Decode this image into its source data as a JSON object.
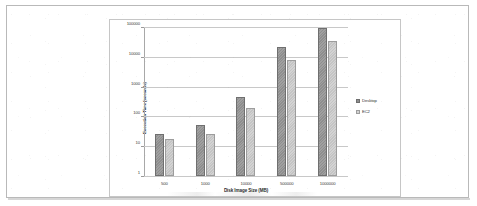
{
  "chart_data": {
    "type": "bar",
    "title": "",
    "subtitle": "",
    "xlabel": "Disk Image Size (MB)",
    "ylabel": "Execution Time (seconds)",
    "categories": [
      "500",
      "1000",
      "10000",
      "500000",
      "1000000"
    ],
    "series": [
      {
        "name": "Desktop",
        "color": "#8e8e8e",
        "values": [
          25,
          50,
          450,
          22000,
          90000
        ]
      },
      {
        "name": "EC2",
        "color": "#d3d3d3",
        "values": [
          17,
          25,
          190,
          8000,
          35000
        ]
      }
    ],
    "yscale": "log",
    "ylim": [
      1,
      100000
    ],
    "ytick_labels": [
      "1",
      "10",
      "100",
      "1000",
      "10000",
      "100000"
    ],
    "ytick_values": [
      1,
      10,
      100,
      1000,
      10000,
      100000
    ],
    "grid": true,
    "legend_position": "right"
  },
  "legend": {
    "items": [
      {
        "label": "Desktop"
      },
      {
        "label": "EC2"
      }
    ]
  }
}
